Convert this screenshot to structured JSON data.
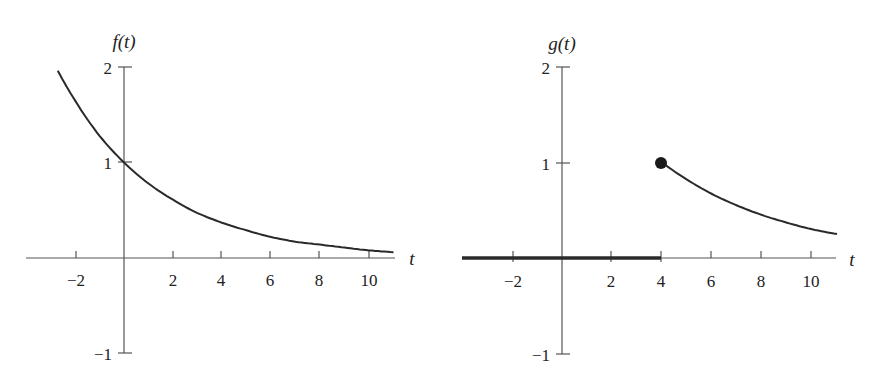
{
  "chart_data": [
    {
      "type": "line",
      "title": "",
      "ylabel": "f(t)",
      "xlabel": "t",
      "xlim": [
        -3.5,
        11
      ],
      "ylim": [
        -1,
        2
      ],
      "x_ticks": [
        -2,
        2,
        4,
        6,
        8,
        10
      ],
      "y_ticks": [
        2,
        1,
        -1
      ],
      "grid": false,
      "legend": null,
      "series": [
        {
          "name": "f(t)",
          "x": [
            -2.7,
            -2,
            -1,
            0,
            1,
            2,
            3,
            4,
            5,
            6,
            7,
            8,
            9,
            10,
            11
          ],
          "values": [
            1.96,
            1.65,
            1.28,
            1.0,
            0.78,
            0.61,
            0.47,
            0.37,
            0.29,
            0.22,
            0.17,
            0.14,
            0.11,
            0.08,
            0.06
          ]
        }
      ]
    },
    {
      "type": "line",
      "title": "",
      "ylabel": "g(t)",
      "xlabel": "t",
      "xlim": [
        -4,
        11
      ],
      "ylim": [
        -1,
        2
      ],
      "x_ticks": [
        -2,
        2,
        4,
        6,
        8,
        10
      ],
      "y_ticks": [
        2,
        1,
        -1
      ],
      "grid": false,
      "legend": null,
      "series": [
        {
          "name": "g(t) zero segment",
          "x": [
            -4,
            4
          ],
          "values": [
            0,
            0
          ]
        },
        {
          "name": "g(t) decay",
          "x": [
            4,
            5,
            6,
            7,
            8,
            9,
            10,
            11
          ],
          "values": [
            1.0,
            0.82,
            0.67,
            0.55,
            0.45,
            0.37,
            0.3,
            0.25
          ]
        }
      ],
      "annotations": [
        {
          "type": "filled-dot",
          "x": 4,
          "y": 1
        }
      ]
    }
  ],
  "left": {
    "ylabel": "f(t)",
    "xlabel": "t",
    "x_ticks": [
      "−2",
      "2",
      "4",
      "6",
      "8",
      "10"
    ],
    "y_ticks": [
      "2",
      "1",
      "−1"
    ]
  },
  "right": {
    "ylabel": "g(t)",
    "xlabel": "t",
    "x_ticks": [
      "−2",
      "2",
      "4",
      "6",
      "8",
      "10"
    ],
    "y_ticks": [
      "2",
      "1",
      "−1"
    ]
  }
}
